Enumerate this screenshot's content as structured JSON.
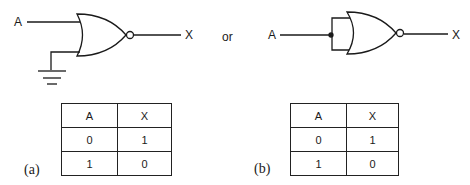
{
  "figure_a": {
    "input_label": "A",
    "output_label": "X",
    "caption": "(a)",
    "description": "NOR gate with second input tied to ground",
    "truth_table": {
      "headers": [
        "A",
        "X"
      ],
      "rows": [
        [
          "0",
          "1"
        ],
        [
          "1",
          "0"
        ]
      ]
    }
  },
  "connector": "or",
  "figure_b": {
    "input_label": "A",
    "output_label": "X",
    "caption": "(b)",
    "description": "NOR gate with both inputs tied together",
    "truth_table": {
      "headers": [
        "A",
        "X"
      ],
      "rows": [
        [
          "0",
          "1"
        ],
        [
          "1",
          "0"
        ]
      ]
    }
  },
  "colors": {
    "line": "#1a1a1a",
    "background": "#ffffff"
  }
}
